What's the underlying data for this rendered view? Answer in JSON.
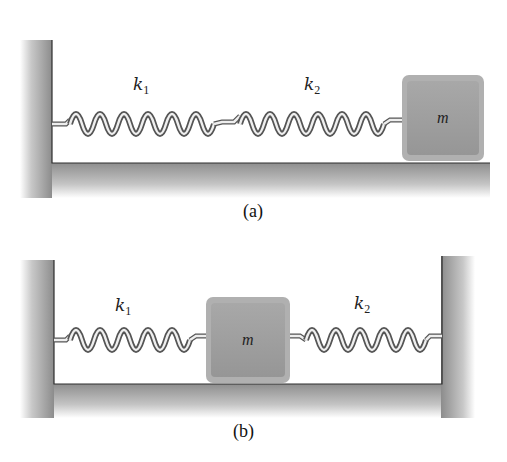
{
  "figure": {
    "panels": [
      {
        "id": "a",
        "caption": "(a)",
        "description": "Mass m attached to wall through two springs in series",
        "springs": [
          {
            "label_base": "k",
            "label_sub": "1",
            "coils": 12
          },
          {
            "label_base": "k",
            "label_sub": "2",
            "coils": 12
          }
        ],
        "block_label": "m"
      },
      {
        "id": "b",
        "caption": "(b)",
        "description": "Mass m between two walls, connected by two springs in parallel configuration",
        "springs": [
          {
            "label_base": "k",
            "label_sub": "1",
            "coils": 10
          },
          {
            "label_base": "k",
            "label_sub": "2",
            "coils": 10
          }
        ],
        "block_label": "m"
      }
    ],
    "colors": {
      "wall_dark": "#8a8a8a",
      "wall_light": "#ffffff",
      "block_fill": "#9e9e9e",
      "block_edge": "#bdbdbd",
      "spring_dark": "#555555",
      "spring_light": "#f2f2f2",
      "outline": "#333333"
    }
  }
}
